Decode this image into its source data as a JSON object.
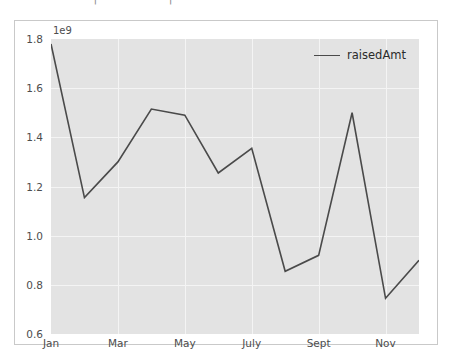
{
  "top_strip": {
    "fragment_text": "– –– –– ––  |  –– – ––  |  –– –"
  },
  "chart_data": {
    "type": "line",
    "title": "",
    "xlabel": "",
    "ylabel": "",
    "y_exponent_label": "1e9",
    "categories": [
      "Jan",
      "Feb",
      "Mar",
      "Apr",
      "May",
      "June",
      "July",
      "Aug",
      "Sept",
      "Oct",
      "Nov",
      "Dec"
    ],
    "x_tick_labels": [
      "Jan",
      "Mar",
      "May",
      "July",
      "Sept",
      "Nov"
    ],
    "x_tick_indices": [
      0,
      2,
      4,
      6,
      8,
      10
    ],
    "y_tick_labels": [
      "0.6",
      "0.8",
      "1.0",
      "1.2",
      "1.4",
      "1.6",
      "1.8"
    ],
    "y_tick_values": [
      600000000,
      800000000,
      1000000000,
      1200000000,
      1400000000,
      1600000000,
      1800000000
    ],
    "ylim": [
      600000000,
      1800000000
    ],
    "xlim": [
      0,
      11
    ],
    "grid": true,
    "legend_position": "upper right",
    "series": [
      {
        "name": "raisedAmt",
        "color": "#4a4a4a",
        "values": [
          1780000000,
          1155000000,
          1300000000,
          1515000000,
          1490000000,
          1255000000,
          1355000000,
          855000000,
          920000000,
          1500000000,
          745000000,
          900000000
        ]
      }
    ]
  },
  "legend": {
    "entries": [
      {
        "label": "raisedAmt",
        "color": "#4a4a4a"
      }
    ]
  },
  "colors": {
    "figure_background": "#ffffff",
    "axes_background": "#e3e3e3",
    "grid": "#f4f4f4",
    "line": "#4a4a4a",
    "tick_text": "#4d4d4d",
    "figure_border": "#c9c9c9"
  }
}
